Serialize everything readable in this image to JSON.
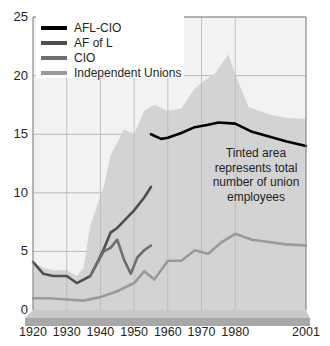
{
  "legend": {
    "items": [
      {
        "label": "AFL-CIO",
        "color": "#000000",
        "icon": "line-swatch-icon"
      },
      {
        "label": "AF of L",
        "color": "#4f4f4f",
        "icon": "line-swatch-icon"
      },
      {
        "label": "CIO",
        "color": "#6e6e6e",
        "icon": "line-swatch-icon"
      },
      {
        "label": "Independent Unions",
        "color": "#9a9a9a",
        "icon": "line-swatch-icon"
      }
    ]
  },
  "annotation": {
    "line1": "Tinted area",
    "line2": "represents total",
    "line3": "number of union",
    "line4": "employees"
  },
  "axis": {
    "y_labels": [
      "25",
      "20",
      "15",
      "10",
      "5",
      "0"
    ],
    "x_labels": [
      "1920",
      "1930",
      "1940",
      "1950",
      "1960",
      "1970",
      "1980",
      "2001"
    ]
  },
  "colors": {
    "tint_area": "#d3d3d3",
    "grid": "#b9b9b9",
    "axis": "#8c8c8c",
    "base_top": "#c9c9c9",
    "base_front": "#a8a8a8",
    "plot_bg": "#f2f2f2"
  },
  "chart_data": {
    "type": "line",
    "title": "",
    "subtitle": "",
    "xlabel": "",
    "ylabel": "",
    "xlim": [
      1920,
      2001
    ],
    "ylim": [
      0,
      25
    ],
    "grid": true,
    "legend_position": "top-left",
    "y_ticks": [
      0,
      5,
      10,
      15,
      20,
      25
    ],
    "x_ticks": [
      1920,
      1930,
      1940,
      1950,
      1960,
      1970,
      1980,
      2001
    ],
    "units": "millions of union employees",
    "area_series": {
      "name": "Total union employees (tinted area)",
      "color": "#d3d3d3",
      "points": [
        [
          1920,
          4.1
        ],
        [
          1923,
          3.6
        ],
        [
          1926,
          3.4
        ],
        [
          1930,
          3.4
        ],
        [
          1933,
          2.9
        ],
        [
          1935,
          3.6
        ],
        [
          1937,
          7.2
        ],
        [
          1939,
          8.9
        ],
        [
          1941,
          10.5
        ],
        [
          1943,
          13.2
        ],
        [
          1945,
          14.3
        ],
        [
          1947,
          15.4
        ],
        [
          1950,
          15.0
        ],
        [
          1953,
          17.0
        ],
        [
          1956,
          17.5
        ],
        [
          1960,
          17.0
        ],
        [
          1964,
          17.2
        ],
        [
          1968,
          18.9
        ],
        [
          1970,
          19.4
        ],
        [
          1974,
          20.2
        ],
        [
          1978,
          21.8
        ],
        [
          1980,
          20.1
        ],
        [
          1984,
          17.3
        ],
        [
          1990,
          16.7
        ],
        [
          1995,
          16.4
        ],
        [
          2001,
          16.3
        ]
      ]
    },
    "series": [
      {
        "name": "AFL-CIO",
        "color": "#000000",
        "points": [
          [
            1955,
            15.0
          ],
          [
            1958,
            14.6
          ],
          [
            1960,
            14.7
          ],
          [
            1964,
            15.1
          ],
          [
            1968,
            15.6
          ],
          [
            1972,
            15.8
          ],
          [
            1975,
            16.0
          ],
          [
            1980,
            15.9
          ],
          [
            1985,
            15.2
          ],
          [
            1990,
            14.8
          ],
          [
            1995,
            14.4
          ],
          [
            2001,
            14.0
          ]
        ]
      },
      {
        "name": "AF of L",
        "color": "#4f4f4f",
        "points": [
          [
            1920,
            4.1
          ],
          [
            1923,
            3.1
          ],
          [
            1926,
            2.9
          ],
          [
            1930,
            2.9
          ],
          [
            1933,
            2.3
          ],
          [
            1935,
            2.6
          ],
          [
            1937,
            2.9
          ],
          [
            1939,
            4.0
          ],
          [
            1941,
            5.2
          ],
          [
            1943,
            6.6
          ],
          [
            1945,
            7.0
          ],
          [
            1947,
            7.6
          ],
          [
            1950,
            8.5
          ],
          [
            1953,
            9.6
          ],
          [
            1955,
            10.5
          ]
        ]
      },
      {
        "name": "CIO",
        "color": "#6e6e6e",
        "points": [
          [
            1937,
            2.9
          ],
          [
            1939,
            4.0
          ],
          [
            1941,
            5.0
          ],
          [
            1943,
            5.3
          ],
          [
            1945,
            6.0
          ],
          [
            1947,
            4.3
          ],
          [
            1949,
            3.1
          ],
          [
            1951,
            4.5
          ],
          [
            1953,
            5.1
          ],
          [
            1955,
            5.5
          ]
        ]
      },
      {
        "name": "Independent Unions",
        "color": "#9a9a9a",
        "points": [
          [
            1920,
            1.0
          ],
          [
            1925,
            1.0
          ],
          [
            1930,
            0.9
          ],
          [
            1935,
            0.8
          ],
          [
            1940,
            1.1
          ],
          [
            1945,
            1.6
          ],
          [
            1950,
            2.3
          ],
          [
            1953,
            3.3
          ],
          [
            1956,
            2.6
          ],
          [
            1960,
            4.2
          ],
          [
            1964,
            4.2
          ],
          [
            1968,
            5.1
          ],
          [
            1972,
            4.8
          ],
          [
            1976,
            5.8
          ],
          [
            1980,
            6.5
          ],
          [
            1985,
            6.0
          ],
          [
            1990,
            5.8
          ],
          [
            1995,
            5.6
          ],
          [
            2001,
            5.5
          ]
        ]
      }
    ]
  }
}
